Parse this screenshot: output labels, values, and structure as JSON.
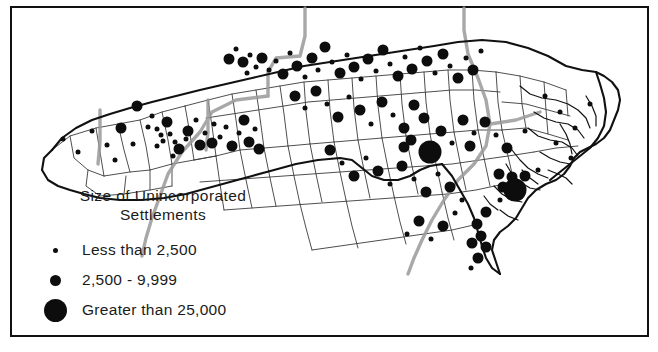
{
  "map": {
    "region_name": "North Carolina",
    "colors": {
      "frame": "#111111",
      "state_border": "#111111",
      "county_border": "#3a3a3a",
      "region_line": "#9a9a9a",
      "symbol": "#0d0d0d",
      "background": "#ffffff"
    }
  },
  "legend": {
    "title_line1": "Size of Unincorporated",
    "title_line2": "Settlements",
    "entries": [
      {
        "symbol": "small-dot",
        "label": "Less than 2,500"
      },
      {
        "symbol": "medium-dot",
        "label": "2,500 - 9,999"
      },
      {
        "symbol": "large-dot",
        "label": "Greater than 25,000"
      }
    ]
  },
  "chart_data": {
    "type": "map",
    "title": "Size of Unincorporated Settlements",
    "region": "North Carolina",
    "symbol_classes": [
      {
        "name": "Less than 2,500",
        "radius_px": 2.5,
        "population_range": [
          0,
          2499
        ]
      },
      {
        "name": "2,500 - 9,999",
        "radius_px": 5.5,
        "population_range": [
          2500,
          9999
        ]
      },
      {
        "name": "Greater than 25,000",
        "radius_px": 11.5,
        "population_range": [
          25000,
          null
        ]
      }
    ],
    "points": [
      {
        "x": 121,
        "y": 128,
        "size": "medium"
      },
      {
        "x": 137,
        "y": 106,
        "size": "medium"
      },
      {
        "x": 152,
        "y": 116,
        "size": "small"
      },
      {
        "x": 133,
        "y": 144,
        "size": "small"
      },
      {
        "x": 148,
        "y": 127,
        "size": "small"
      },
      {
        "x": 157,
        "y": 129,
        "size": "small"
      },
      {
        "x": 161,
        "y": 135,
        "size": "small"
      },
      {
        "x": 167,
        "y": 122,
        "size": "medium"
      },
      {
        "x": 170,
        "y": 134,
        "size": "small"
      },
      {
        "x": 163,
        "y": 141,
        "size": "small"
      },
      {
        "x": 157,
        "y": 146,
        "size": "small"
      },
      {
        "x": 175,
        "y": 142,
        "size": "small"
      },
      {
        "x": 179,
        "y": 149,
        "size": "medium"
      },
      {
        "x": 186,
        "y": 139,
        "size": "small"
      },
      {
        "x": 173,
        "y": 156,
        "size": "small"
      },
      {
        "x": 188,
        "y": 131,
        "size": "medium"
      },
      {
        "x": 196,
        "y": 120,
        "size": "small"
      },
      {
        "x": 200,
        "y": 145,
        "size": "medium"
      },
      {
        "x": 205,
        "y": 133,
        "size": "small"
      },
      {
        "x": 214,
        "y": 124,
        "size": "small"
      },
      {
        "x": 212,
        "y": 143,
        "size": "medium"
      },
      {
        "x": 220,
        "y": 137,
        "size": "small"
      },
      {
        "x": 226,
        "y": 127,
        "size": "small"
      },
      {
        "x": 232,
        "y": 146,
        "size": "medium"
      },
      {
        "x": 239,
        "y": 133,
        "size": "small"
      },
      {
        "x": 244,
        "y": 120,
        "size": "medium"
      },
      {
        "x": 249,
        "y": 142,
        "size": "medium"
      },
      {
        "x": 255,
        "y": 129,
        "size": "small"
      },
      {
        "x": 259,
        "y": 149,
        "size": "medium"
      },
      {
        "x": 229,
        "y": 59,
        "size": "medium"
      },
      {
        "x": 236,
        "y": 49,
        "size": "small"
      },
      {
        "x": 243,
        "y": 62,
        "size": "medium"
      },
      {
        "x": 250,
        "y": 55,
        "size": "small"
      },
      {
        "x": 256,
        "y": 67,
        "size": "small"
      },
      {
        "x": 247,
        "y": 73,
        "size": "small"
      },
      {
        "x": 262,
        "y": 58,
        "size": "medium"
      },
      {
        "x": 269,
        "y": 70,
        "size": "small"
      },
      {
        "x": 276,
        "y": 61,
        "size": "small"
      },
      {
        "x": 283,
        "y": 74,
        "size": "medium"
      },
      {
        "x": 290,
        "y": 53,
        "size": "small"
      },
      {
        "x": 297,
        "y": 66,
        "size": "medium"
      },
      {
        "x": 305,
        "y": 77,
        "size": "small"
      },
      {
        "x": 312,
        "y": 58,
        "size": "medium"
      },
      {
        "x": 318,
        "y": 70,
        "size": "small"
      },
      {
        "x": 325,
        "y": 47,
        "size": "medium"
      },
      {
        "x": 332,
        "y": 62,
        "size": "small"
      },
      {
        "x": 340,
        "y": 73,
        "size": "medium"
      },
      {
        "x": 347,
        "y": 55,
        "size": "small"
      },
      {
        "x": 354,
        "y": 67,
        "size": "medium"
      },
      {
        "x": 361,
        "y": 79,
        "size": "small"
      },
      {
        "x": 368,
        "y": 59,
        "size": "medium"
      },
      {
        "x": 376,
        "y": 71,
        "size": "small"
      },
      {
        "x": 383,
        "y": 50,
        "size": "medium"
      },
      {
        "x": 390,
        "y": 64,
        "size": "small"
      },
      {
        "x": 398,
        "y": 76,
        "size": "medium"
      },
      {
        "x": 405,
        "y": 57,
        "size": "small"
      },
      {
        "x": 412,
        "y": 69,
        "size": "medium"
      },
      {
        "x": 420,
        "y": 48,
        "size": "small"
      },
      {
        "x": 427,
        "y": 61,
        "size": "medium"
      },
      {
        "x": 435,
        "y": 73,
        "size": "small"
      },
      {
        "x": 443,
        "y": 54,
        "size": "medium"
      },
      {
        "x": 450,
        "y": 66,
        "size": "small"
      },
      {
        "x": 458,
        "y": 78,
        "size": "medium"
      },
      {
        "x": 466,
        "y": 58,
        "size": "small"
      },
      {
        "x": 473,
        "y": 70,
        "size": "medium"
      },
      {
        "x": 481,
        "y": 51,
        "size": "small"
      },
      {
        "x": 295,
        "y": 96,
        "size": "medium"
      },
      {
        "x": 305,
        "y": 108,
        "size": "small"
      },
      {
        "x": 316,
        "y": 91,
        "size": "medium"
      },
      {
        "x": 327,
        "y": 104,
        "size": "small"
      },
      {
        "x": 338,
        "y": 117,
        "size": "medium"
      },
      {
        "x": 349,
        "y": 97,
        "size": "small"
      },
      {
        "x": 360,
        "y": 110,
        "size": "medium"
      },
      {
        "x": 371,
        "y": 124,
        "size": "small"
      },
      {
        "x": 382,
        "y": 102,
        "size": "medium"
      },
      {
        "x": 393,
        "y": 115,
        "size": "small"
      },
      {
        "x": 404,
        "y": 128,
        "size": "medium"
      },
      {
        "x": 414,
        "y": 105,
        "size": "medium"
      },
      {
        "x": 424,
        "y": 118,
        "size": "medium"
      },
      {
        "x": 430,
        "y": 152,
        "size": "large"
      },
      {
        "x": 411,
        "y": 140,
        "size": "medium"
      },
      {
        "x": 404,
        "y": 147,
        "size": "medium"
      },
      {
        "x": 441,
        "y": 131,
        "size": "medium"
      },
      {
        "x": 452,
        "y": 143,
        "size": "small"
      },
      {
        "x": 463,
        "y": 120,
        "size": "medium"
      },
      {
        "x": 474,
        "y": 133,
        "size": "small"
      },
      {
        "x": 470,
        "y": 146,
        "size": "medium"
      },
      {
        "x": 485,
        "y": 122,
        "size": "medium"
      },
      {
        "x": 496,
        "y": 135,
        "size": "small"
      },
      {
        "x": 507,
        "y": 148,
        "size": "medium"
      },
      {
        "x": 330,
        "y": 150,
        "size": "medium"
      },
      {
        "x": 342,
        "y": 163,
        "size": "small"
      },
      {
        "x": 354,
        "y": 176,
        "size": "medium"
      },
      {
        "x": 366,
        "y": 158,
        "size": "small"
      },
      {
        "x": 378,
        "y": 171,
        "size": "medium"
      },
      {
        "x": 390,
        "y": 184,
        "size": "small"
      },
      {
        "x": 402,
        "y": 166,
        "size": "medium"
      },
      {
        "x": 414,
        "y": 179,
        "size": "small"
      },
      {
        "x": 426,
        "y": 192,
        "size": "medium"
      },
      {
        "x": 438,
        "y": 174,
        "size": "small"
      },
      {
        "x": 450,
        "y": 187,
        "size": "medium"
      },
      {
        "x": 462,
        "y": 200,
        "size": "small"
      },
      {
        "x": 499,
        "y": 174,
        "size": "medium"
      },
      {
        "x": 512,
        "y": 177,
        "size": "medium"
      },
      {
        "x": 525,
        "y": 176,
        "size": "medium"
      },
      {
        "x": 503,
        "y": 187,
        "size": "medium"
      },
      {
        "x": 515,
        "y": 190,
        "size": "large"
      },
      {
        "x": 500,
        "y": 200,
        "size": "small"
      },
      {
        "x": 486,
        "y": 212,
        "size": "medium"
      },
      {
        "x": 477,
        "y": 224,
        "size": "medium"
      },
      {
        "x": 481,
        "y": 236,
        "size": "medium"
      },
      {
        "x": 472,
        "y": 243,
        "size": "medium"
      },
      {
        "x": 486,
        "y": 247,
        "size": "medium"
      },
      {
        "x": 478,
        "y": 258,
        "size": "medium"
      },
      {
        "x": 471,
        "y": 268,
        "size": "small"
      },
      {
        "x": 455,
        "y": 213,
        "size": "small"
      },
      {
        "x": 443,
        "y": 226,
        "size": "medium"
      },
      {
        "x": 431,
        "y": 239,
        "size": "small"
      },
      {
        "x": 419,
        "y": 221,
        "size": "medium"
      },
      {
        "x": 407,
        "y": 234,
        "size": "small"
      },
      {
        "x": 545,
        "y": 96,
        "size": "small"
      },
      {
        "x": 560,
        "y": 112,
        "size": "small"
      },
      {
        "x": 575,
        "y": 128,
        "size": "small"
      },
      {
        "x": 590,
        "y": 104,
        "size": "small"
      },
      {
        "x": 556,
        "y": 143,
        "size": "small"
      },
      {
        "x": 571,
        "y": 158,
        "size": "small"
      },
      {
        "x": 538,
        "y": 170,
        "size": "small"
      },
      {
        "x": 525,
        "y": 131,
        "size": "small"
      },
      {
        "x": 63,
        "y": 139,
        "size": "small"
      },
      {
        "x": 78,
        "y": 152,
        "size": "small"
      },
      {
        "x": 92,
        "y": 131,
        "size": "small"
      },
      {
        "x": 107,
        "y": 145,
        "size": "small"
      },
      {
        "x": 115,
        "y": 160,
        "size": "small"
      }
    ]
  }
}
